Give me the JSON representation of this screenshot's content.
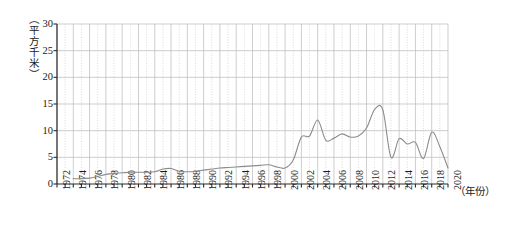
{
  "chart_data": {
    "type": "line",
    "title": "",
    "subtitle": "",
    "xlabel": "（年份）",
    "ylabel": "（平方千米）",
    "xlim": [
      1972,
      2020
    ],
    "ylim": [
      0,
      30
    ],
    "yticks": [
      0,
      5,
      10,
      15,
      20,
      25,
      30
    ],
    "xticks": [
      1972,
      1974,
      1976,
      1978,
      1980,
      1982,
      1984,
      1986,
      1988,
      1990,
      1992,
      1994,
      1996,
      1998,
      2000,
      2002,
      2004,
      2006,
      2008,
      2010,
      2012,
      2014,
      2016,
      2018,
      2020
    ],
    "xtick_labels": [
      "1972",
      "1974",
      "1976",
      "1978",
      "1980",
      "1982",
      "1984",
      "1986",
      "1988",
      "1990",
      "1992",
      "1994",
      "1996",
      "1998",
      "2000",
      "2002",
      "2004",
      "2006",
      "2008",
      "2010",
      "2012",
      "2014",
      "2016",
      "2018",
      "2020"
    ],
    "ytick_labels": [
      "0",
      "5",
      "10",
      "15",
      "20",
      "25",
      "30"
    ],
    "grid": true,
    "grid_major_step_x": 2,
    "grid_minor_step_x": 1,
    "grid_major_step_y": 5,
    "legend": null,
    "legend_position": "none",
    "line_color": "#8c8c8c",
    "grid_color": "#b9b9b9",
    "axis_color": "#2b2b2b",
    "series": [
      {
        "name": "面积",
        "x": [
          1974,
          1975,
          1976,
          1977,
          1978,
          1979,
          1980,
          1981,
          1982,
          1983,
          1984,
          1985,
          1986,
          1987,
          1988,
          1989,
          1990,
          1991,
          1992,
          1993,
          1994,
          1995,
          1996,
          1997,
          1998,
          1999,
          2000,
          2001,
          2002,
          2003,
          2004,
          2005,
          2006,
          2007,
          2008,
          2009,
          2010,
          2011,
          2012,
          2013,
          2014,
          2015,
          2016,
          2017,
          2018,
          2019,
          2020
        ],
        "values": [
          1.0,
          1.0,
          1.1,
          1.4,
          1.8,
          2.0,
          2.1,
          2.2,
          2.2,
          2.2,
          2.3,
          2.8,
          2.9,
          2.4,
          2.3,
          2.4,
          2.6,
          2.8,
          3.0,
          3.1,
          3.2,
          3.3,
          3.4,
          3.5,
          3.6,
          3.2,
          3.0,
          4.5,
          8.8,
          9.0,
          12.0,
          8.2,
          8.6,
          9.4,
          8.8,
          9.0,
          10.5,
          14.0,
          13.9,
          5.0,
          8.5,
          7.5,
          7.8,
          4.8,
          9.7,
          7.0,
          3.0
        ]
      }
    ]
  }
}
